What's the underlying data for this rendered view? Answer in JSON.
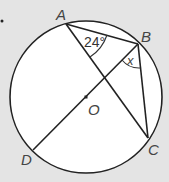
{
  "diagram": {
    "type": "circle-geometry",
    "center": {
      "label": "O"
    },
    "points": [
      {
        "label": "A"
      },
      {
        "label": "B"
      },
      {
        "label": "C"
      },
      {
        "label": "D"
      }
    ],
    "angles": {
      "at_A": "24°",
      "at_B": "x"
    },
    "colors": {
      "background": "#e4e4e4",
      "circle_fill": "#ffffff",
      "stroke": "#222222"
    }
  }
}
